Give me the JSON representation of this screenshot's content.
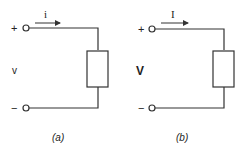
{
  "circuits": [
    {
      "id": "a",
      "caption": "(a)",
      "plus": "+",
      "minus": "−",
      "voltage_label": "v",
      "current_label": "i"
    },
    {
      "id": "b",
      "caption": "(b)",
      "plus": "+",
      "minus": "−",
      "voltage_label": "V",
      "current_label": "I"
    }
  ],
  "colors": {
    "stroke": "#333333",
    "background": "#ffffff"
  }
}
